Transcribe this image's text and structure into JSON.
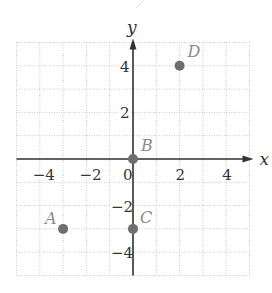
{
  "chart_data": {
    "type": "scatter",
    "title": "",
    "xlabel": "x",
    "ylabel": "y",
    "xlim": [
      -5,
      5
    ],
    "ylim": [
      -5,
      5
    ],
    "grid": true,
    "x_ticks": [
      -4,
      -2,
      0,
      2,
      4
    ],
    "y_ticks": [
      -4,
      -2,
      2,
      4
    ],
    "x_tick_labels": [
      "−4",
      "−2",
      "0",
      "2",
      "4"
    ],
    "y_tick_labels": [
      "−4",
      "−2",
      "2",
      "4"
    ],
    "points": [
      {
        "label": "A",
        "x": -3,
        "y": -3
      },
      {
        "label": "B",
        "x": 0,
        "y": 0
      },
      {
        "label": "C",
        "x": 0,
        "y": -3
      },
      {
        "label": "D",
        "x": 2,
        "y": 4
      }
    ]
  },
  "colors": {
    "grid": "#c8c8c8",
    "axis": "#333333",
    "point": "#6e6e6e",
    "point_label": "#8a8a8a"
  }
}
